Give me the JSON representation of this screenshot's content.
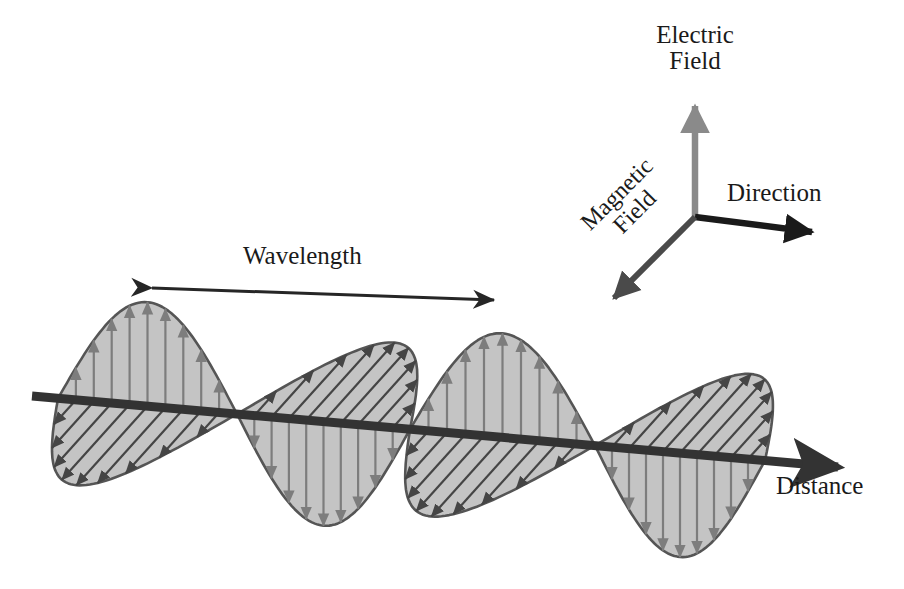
{
  "figure": {
    "background_color": "#ffffff"
  },
  "labels": {
    "electric_field": "Electric\nField",
    "magnetic_field": "Magnetic\nField",
    "direction": "Direction",
    "distance": "Distance",
    "wavelength": "Wavelength"
  },
  "colors": {
    "lobe_fill": "#c4c4c4",
    "lobe_outline": "#555555",
    "electric_arrow": "#7d7d7d",
    "magnetic_arrow": "#454545",
    "axis_line": "#333333",
    "text": "#1a1a1a",
    "electric_axis": "#8a8a8a",
    "magnetic_axis": "#4a4a4a",
    "direction_axis": "#1a1a1a"
  },
  "chart_data": {
    "type": "line",
    "xlabel": "Distance",
    "ylabel": "Field amplitude",
    "annotations": [
      "Wavelength",
      "Electric Field",
      "Magnetic Field",
      "Direction",
      "Distance"
    ],
    "propagation_axis": {
      "start": [
        32,
        396
      ],
      "end": [
        850,
        468
      ],
      "tip": [
        852,
        468
      ],
      "slope_deg": 5.0
    },
    "wavelength_indicator": {
      "start": [
        148,
        288
      ],
      "end": [
        498,
        300
      ],
      "double_headed": true,
      "label": "Wavelength"
    },
    "nodes_x": [
      58,
      237,
      410,
      595,
      765
    ],
    "amplitude_px": 104,
    "series": [
      {
        "name": "Electric Field",
        "orientation": "vertical",
        "arrow_color": "#7d7d7d",
        "lobes": [
          {
            "index": 0,
            "x_start": 58,
            "x_end": 237,
            "direction": "up",
            "peak_x": 145,
            "peak_y": 297
          },
          {
            "index": 1,
            "x_start": 237,
            "x_end": 410,
            "direction": "down",
            "peak_x": 322,
            "peak_y": 534
          },
          {
            "index": 2,
            "x_start": 410,
            "x_end": 595,
            "direction": "up",
            "peak_x": 500,
            "peak_y": 328
          },
          {
            "index": 3,
            "x_start": 595,
            "x_end": 765,
            "direction": "down",
            "peak_x": 680,
            "peak_y": 570
          }
        ]
      },
      {
        "name": "Magnetic Field",
        "orientation": "diagonal",
        "arrow_color": "#454545",
        "lobes": [
          {
            "index": 0,
            "x_start": 58,
            "x_end": 237,
            "direction": "down-left",
            "peak_x": 145,
            "peak_y": 477
          },
          {
            "index": 1,
            "x_start": 237,
            "x_end": 410,
            "direction": "up-right",
            "peak_x": 322,
            "peak_y": 348
          },
          {
            "index": 2,
            "x_start": 410,
            "x_end": 595,
            "direction": "down-left",
            "peak_x": 500,
            "peak_y": 522
          },
          {
            "index": 3,
            "x_start": 595,
            "x_end": 765,
            "direction": "up-right",
            "peak_x": 680,
            "peak_y": 400
          }
        ]
      }
    ],
    "axis_legend": {
      "origin": [
        695,
        217
      ],
      "axes": [
        {
          "name": "Electric Field",
          "tip": [
            695,
            100
          ],
          "color": "#8a8a8a"
        },
        {
          "name": "Direction",
          "tip": [
            818,
            234
          ],
          "color": "#1a1a1a"
        },
        {
          "name": "Magnetic Field",
          "tip": [
            608,
            303
          ],
          "color": "#4a4a4a"
        }
      ]
    }
  }
}
